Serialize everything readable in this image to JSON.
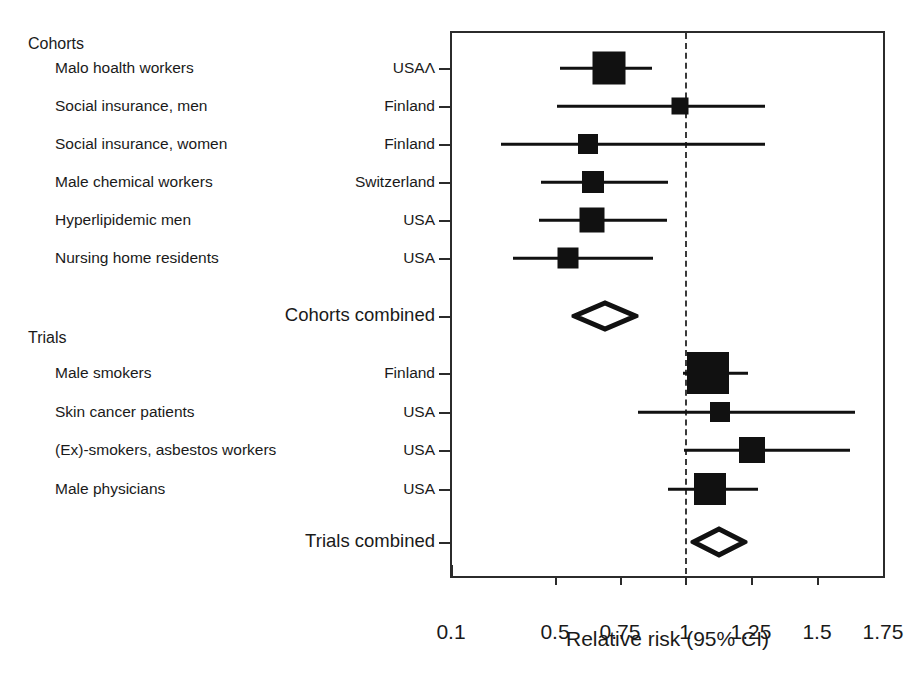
{
  "figure": {
    "type": "forest-plot",
    "axis_title": "Relative risk (95% CI)"
  },
  "sections": [
    {
      "id": "cohorts",
      "label": "Cohorts",
      "y": 36
    },
    {
      "id": "trials",
      "label": "Trials",
      "y": 330
    }
  ],
  "axis": {
    "label": "Relative risk (95% CI)",
    "ticks": [
      {
        "value": "0.1",
        "x": 451
      },
      {
        "value": "0.5",
        "x": 555
      },
      {
        "value": "0.75",
        "x": 620
      },
      {
        "value": "1",
        "x": 685
      },
      {
        "value": "1.25",
        "x": 751
      },
      {
        "value": "1.5",
        "x": 817
      },
      {
        "value": "1.75",
        "x": 883
      }
    ],
    "null_value": "1",
    "null_x": 685,
    "left_edge_x": 450,
    "right_edge_x": 885,
    "top_edge_y": 31,
    "bottom_edge_y": 578
  },
  "rows": [
    {
      "study": "Malo hoalth workers",
      "country": "USAΛ",
      "y": 68,
      "rr": 0.69,
      "lo": 0.53,
      "hi": 0.86,
      "marker": "box",
      "box_px": 33,
      "center_x": 609,
      "lo_x": 560,
      "hi_x": 652
    },
    {
      "study": "Social insurance, men",
      "country": "Finland",
      "y": 106,
      "rr": 0.98,
      "lo": 0.52,
      "hi": 1.3,
      "marker": "box",
      "box_px": 17,
      "center_x": 680,
      "lo_x": 557,
      "hi_x": 765
    },
    {
      "study": "Social insurance, women",
      "country": "Finland",
      "y": 144,
      "rr": 0.62,
      "lo": 0.29,
      "hi": 1.3,
      "marker": "box",
      "box_px": 20,
      "center_x": 588,
      "lo_x": 501,
      "hi_x": 765
    },
    {
      "study": "Male chemical workers",
      "country": "Switzerland",
      "y": 182,
      "rr": 0.64,
      "lo": 0.45,
      "hi": 0.93,
      "marker": "box",
      "box_px": 22,
      "center_x": 593,
      "lo_x": 541,
      "hi_x": 668
    },
    {
      "study": "Hyperlipidemic men",
      "country": "USA",
      "y": 220,
      "rr": 0.64,
      "lo": 0.44,
      "hi": 0.93,
      "marker": "box",
      "box_px": 25,
      "center_x": 592,
      "lo_x": 539,
      "hi_x": 667
    },
    {
      "study": "Nursing home residents",
      "country": "USA",
      "y": 258,
      "rr": 0.55,
      "lo": 0.34,
      "hi": 0.87,
      "marker": "box",
      "box_px": 21,
      "center_x": 568,
      "lo_x": 513,
      "hi_x": 653
    },
    {
      "study": "Male smokers",
      "country": "Finland",
      "y": 373,
      "rr": 1.09,
      "lo": 1.0,
      "hi": 1.24,
      "marker": "box",
      "box_px": 42,
      "center_x": 708,
      "lo_x": 683,
      "hi_x": 748
    },
    {
      "study": "Skin cancer patients",
      "country": "USA",
      "y": 412,
      "rr": 1.13,
      "lo": 0.83,
      "hi": 1.65,
      "marker": "box",
      "box_px": 20,
      "center_x": 720,
      "lo_x": 638,
      "hi_x": 855
    },
    {
      "study": "(Ex)-smokers, asbestos workers",
      "country": "USA",
      "y": 450,
      "rr": 1.25,
      "lo": 1.0,
      "hi": 1.63,
      "marker": "box",
      "box_px": 26,
      "center_x": 752,
      "lo_x": 684,
      "hi_x": 850
    },
    {
      "study": "Male physicians",
      "country": "USA",
      "y": 489,
      "rr": 1.09,
      "lo": 0.94,
      "hi": 1.28,
      "marker": "box",
      "box_px": 32,
      "center_x": 710,
      "lo_x": 668,
      "hi_x": 758
    }
  ],
  "summaries": [
    {
      "label": "Cohorts combined",
      "y": 316,
      "rr": 0.68,
      "lo": 0.63,
      "hi": 0.74,
      "marker": "diamond",
      "center_x": 605,
      "lo_x": 575,
      "hi_x": 636,
      "half_h": 13
    },
    {
      "label": "Trials combined",
      "y": 542,
      "rr": 1.12,
      "lo": 1.05,
      "hi": 1.2,
      "marker": "diamond",
      "center_x": 719,
      "lo_x": 694,
      "hi_x": 745,
      "half_h": 13
    }
  ],
  "colors": {
    "marker": "#111111",
    "frame": "#2b2b2b",
    "text": "#1a1a1a",
    "background": "#ffffff"
  },
  "chart_data": {
    "type": "scatter",
    "title": "",
    "xlabel": "Relative risk (95% CI)",
    "ylabel": "",
    "xlim": [
      0.1,
      1.75
    ],
    "xticks": [
      0.1,
      0.5,
      0.75,
      1,
      1.25,
      1.5,
      1.75
    ],
    "grid": false,
    "legend": "none",
    "reference_line": 1,
    "groups": [
      {
        "name": "Cohorts",
        "studies": [
          {
            "label": "Malo hoalth workers",
            "country": "USAΛ",
            "rr": 0.69,
            "ci_low": 0.53,
            "ci_high": 0.86
          },
          {
            "label": "Social insurance, men",
            "country": "Finland",
            "rr": 0.98,
            "ci_low": 0.52,
            "ci_high": 1.3
          },
          {
            "label": "Social insurance, women",
            "country": "Finland",
            "rr": 0.62,
            "ci_low": 0.29,
            "ci_high": 1.3
          },
          {
            "label": "Male chemical workers",
            "country": "Switzerland",
            "rr": 0.64,
            "ci_low": 0.45,
            "ci_high": 0.93
          },
          {
            "label": "Hyperlipidemic men",
            "country": "USA",
            "rr": 0.64,
            "ci_low": 0.44,
            "ci_high": 0.93
          },
          {
            "label": "Nursing home residents",
            "country": "USA",
            "rr": 0.55,
            "ci_low": 0.34,
            "ci_high": 0.87
          }
        ],
        "summary": {
          "label": "Cohorts combined",
          "rr": 0.68,
          "ci_low": 0.63,
          "ci_high": 0.74
        }
      },
      {
        "name": "Trials",
        "studies": [
          {
            "label": "Male smokers",
            "country": "Finland",
            "rr": 1.09,
            "ci_low": 1.0,
            "ci_high": 1.24
          },
          {
            "label": "Skin cancer patients",
            "country": "USA",
            "rr": 1.13,
            "ci_low": 0.83,
            "ci_high": 1.65
          },
          {
            "label": "(Ex)-smokers, asbestos workers",
            "country": "USA",
            "rr": 1.25,
            "ci_low": 1.0,
            "ci_high": 1.63
          },
          {
            "label": "Male physicians",
            "country": "USA",
            "rr": 1.09,
            "ci_low": 0.94,
            "ci_high": 1.28
          }
        ],
        "summary": {
          "label": "Trials combined",
          "rr": 1.12,
          "ci_low": 1.05,
          "ci_high": 1.2
        }
      }
    ]
  }
}
